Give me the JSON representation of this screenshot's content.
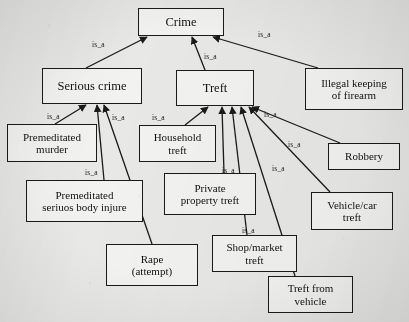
{
  "diagram": {
    "relation_label": "is_a",
    "colors": {
      "background": "#e8e8e6",
      "node_fill": "#f2f2f0",
      "stroke": "#1a1a1a",
      "text": "#111111"
    },
    "nodes": [
      {
        "id": "crime",
        "label": "Crime",
        "lines": [
          "Crime"
        ],
        "x": 138,
        "y": 8,
        "w": 86,
        "h": 28,
        "font": 12.5
      },
      {
        "id": "serious-crime",
        "label": "Serious crime",
        "lines": [
          "Serious crime"
        ],
        "x": 42,
        "y": 68,
        "w": 100,
        "h": 36,
        "font": 12.5
      },
      {
        "id": "treft",
        "label": "Treft",
        "lines": [
          "Treft"
        ],
        "x": 176,
        "y": 70,
        "w": 78,
        "h": 36,
        "font": 12.5
      },
      {
        "id": "illegal-firearm",
        "label": "Illegal keeping of firearm",
        "lines": [
          "Illegal keeping",
          "of firearm"
        ],
        "x": 305,
        "y": 68,
        "w": 98,
        "h": 42,
        "font": 11
      },
      {
        "id": "premeditated-murder",
        "label": "Premeditated murder",
        "lines": [
          "Premeditated",
          "murder"
        ],
        "x": 7,
        "y": 124,
        "w": 90,
        "h": 38,
        "font": 11
      },
      {
        "id": "household-treft",
        "label": "Household treft",
        "lines": [
          "Household",
          "treft"
        ],
        "x": 139,
        "y": 125,
        "w": 77,
        "h": 37,
        "font": 11
      },
      {
        "id": "robbery",
        "label": "Robbery",
        "lines": [
          "Robbery"
        ],
        "x": 328,
        "y": 143,
        "w": 72,
        "h": 27,
        "font": 11
      },
      {
        "id": "premeditated-injure",
        "label": "Premeditated seriuos body injure",
        "lines": [
          "Premeditated",
          "seriuos body injure"
        ],
        "x": 26,
        "y": 180,
        "w": 117,
        "h": 42,
        "font": 11
      },
      {
        "id": "private-property",
        "label": "Private property treft",
        "lines": [
          "Private",
          "property treft"
        ],
        "x": 164,
        "y": 173,
        "w": 92,
        "h": 42,
        "font": 11
      },
      {
        "id": "vehicle-car-treft",
        "label": "Vehicle/car treft",
        "lines": [
          "Vehicle/car",
          "treft"
        ],
        "x": 311,
        "y": 192,
        "w": 82,
        "h": 38,
        "font": 11
      },
      {
        "id": "rape-attempt",
        "label": "Rape (attempt)",
        "lines": [
          "Rape",
          "(attempt)"
        ],
        "x": 106,
        "y": 244,
        "w": 92,
        "h": 42,
        "font": 11
      },
      {
        "id": "shop-market-treft",
        "label": "Shop/market treft",
        "lines": [
          "Shop/market",
          "treft"
        ],
        "x": 212,
        "y": 235,
        "w": 85,
        "h": 37,
        "font": 11
      },
      {
        "id": "treft-from-vehicle",
        "label": "Treft from vehicle",
        "lines": [
          "Treft from",
          "vehicle"
        ],
        "x": 268,
        "y": 276,
        "w": 85,
        "h": 37,
        "font": 11
      }
    ],
    "edges": [
      {
        "id": "e1",
        "from": "serious-crime",
        "to": "crime",
        "label": "is_a",
        "x1": 86,
        "y1": 68,
        "x2": 147,
        "y2": 37
      },
      {
        "id": "e2",
        "from": "treft",
        "to": "crime",
        "label": "is_a",
        "x1": 205,
        "y1": 70,
        "x2": 192,
        "y2": 37
      },
      {
        "id": "e3",
        "from": "illegal-firearm",
        "to": "crime",
        "label": "is_a",
        "x1": 318,
        "y1": 68,
        "x2": 213,
        "y2": 37
      },
      {
        "id": "e4",
        "from": "premeditated-murder",
        "to": "serious-crime",
        "label": "is_a",
        "x1": 55,
        "y1": 124,
        "x2": 86,
        "y2": 105
      },
      {
        "id": "e5",
        "from": "premeditated-injure",
        "to": "serious-crime",
        "label": "is_a",
        "x1": 104,
        "y1": 180,
        "x2": 97,
        "y2": 105
      },
      {
        "id": "e6",
        "from": "rape-attempt",
        "to": "serious-crime",
        "label": "is_a",
        "x1": 152,
        "y1": 244,
        "x2": 104,
        "y2": 105
      },
      {
        "id": "e7",
        "from": "household-treft",
        "to": "treft",
        "label": "is_a",
        "x1": 185,
        "y1": 125,
        "x2": 208,
        "y2": 107
      },
      {
        "id": "e8",
        "from": "private-property",
        "to": "treft",
        "label": "is_a",
        "x1": 224,
        "y1": 173,
        "x2": 222,
        "y2": 107
      },
      {
        "id": "e9",
        "from": "shop-market-treft",
        "to": "treft",
        "label": "is_a",
        "x1": 247,
        "y1": 235,
        "x2": 232,
        "y2": 107
      },
      {
        "id": "e10",
        "from": "treft-from-vehicle",
        "to": "treft",
        "label": "is_a",
        "x1": 295,
        "y1": 276,
        "x2": 241,
        "y2": 107
      },
      {
        "id": "e11",
        "from": "vehicle-car-treft",
        "to": "treft",
        "label": "is_a",
        "x1": 330,
        "y1": 192,
        "x2": 249,
        "y2": 107
      },
      {
        "id": "e12",
        "from": "robbery",
        "to": "treft",
        "label": "is_a",
        "x1": 340,
        "y1": 143,
        "x2": 252,
        "y2": 107
      }
    ],
    "edge_labels": [
      {
        "id": "l1",
        "text": "is_a",
        "x": 92,
        "y": 40
      },
      {
        "id": "l2",
        "text": "is_a",
        "x": 204,
        "y": 52
      },
      {
        "id": "l3",
        "text": "is_a",
        "x": 258,
        "y": 30
      },
      {
        "id": "l4",
        "text": "is_a",
        "x": 47,
        "y": 112
      },
      {
        "id": "l5",
        "text": "is_a",
        "x": 112,
        "y": 113
      },
      {
        "id": "l6",
        "text": "is_a",
        "x": 85,
        "y": 168
      },
      {
        "id": "l7",
        "text": "is_a",
        "x": 152,
        "y": 113
      },
      {
        "id": "l8",
        "text": "is_a",
        "x": 222,
        "y": 166
      },
      {
        "id": "l9",
        "text": "is_a",
        "x": 264,
        "y": 110
      },
      {
        "id": "l10",
        "text": "is_a",
        "x": 288,
        "y": 140
      },
      {
        "id": "l11",
        "text": "is_a",
        "x": 272,
        "y": 164
      },
      {
        "id": "l12",
        "text": "is_a",
        "x": 242,
        "y": 226
      }
    ]
  }
}
